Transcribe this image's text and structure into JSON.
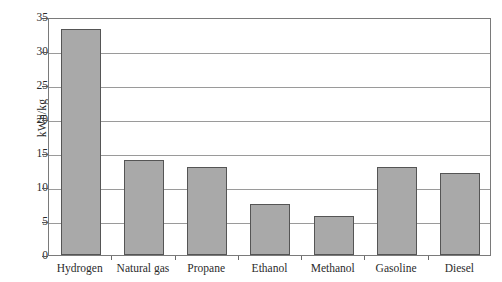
{
  "chart_data": {
    "type": "bar",
    "title": "",
    "xlabel": "",
    "ylabel": "kWh/kg",
    "ylim": [
      0,
      35
    ],
    "yticks": [
      0,
      5,
      10,
      15,
      20,
      25,
      30,
      35
    ],
    "ytick_labels": [
      "0",
      "5",
      "10",
      "15",
      "20",
      "25",
      "30",
      "35"
    ],
    "grid": "horizontal",
    "legend": "none",
    "bar_color": "#a9a9a9",
    "bar_edge_color": "#555555",
    "frame_color": "#7a7a7a",
    "gridline_color": "#9a9a9a",
    "categories": [
      "Hydrogen",
      "Natural gas",
      "Propane",
      "Ethanol",
      "Methanol",
      "Gasoline",
      "Diesel"
    ],
    "values": [
      33.3,
      14.0,
      13.0,
      7.5,
      5.7,
      13.0,
      12.0
    ]
  }
}
